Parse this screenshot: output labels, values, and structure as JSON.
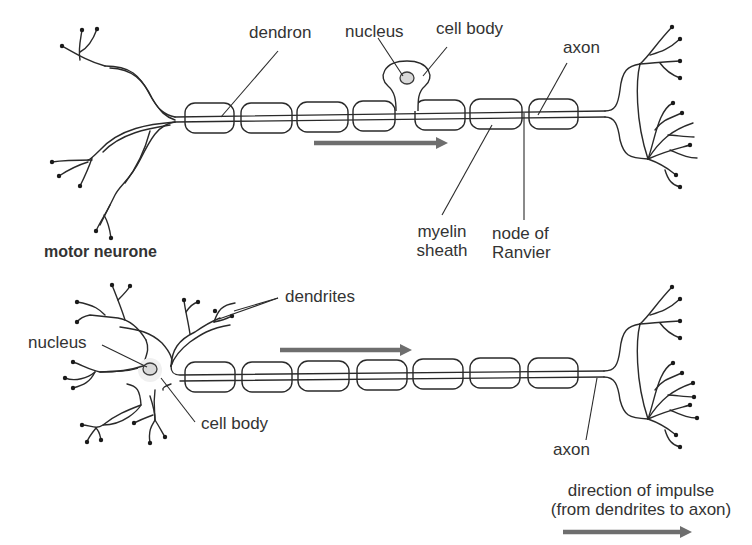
{
  "figure": {
    "title": "motor neurone",
    "motor_neurone": {
      "labels": {
        "dendron": "dendron",
        "nucleus": "nucleus",
        "cell_body": "cell body",
        "axon": "axon",
        "myelin_sheath_line1": "myelin",
        "myelin_sheath_line2": "sheath",
        "node_line1": "node of",
        "node_line2": "Ranvier"
      },
      "myelin_segment_count": 7
    },
    "sensory_neurone": {
      "labels": {
        "dendrites": "dendrites",
        "nucleus": "nucleus",
        "cell_body": "cell body",
        "axon": "axon"
      },
      "myelin_segment_count": 7
    },
    "legend": {
      "line1": "direction of impulse",
      "line2": "(from dendrites to axon)",
      "arrow_color": "#6e6e6e"
    }
  }
}
